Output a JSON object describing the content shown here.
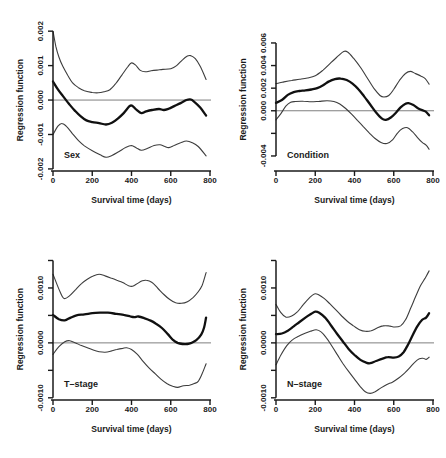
{
  "figure": {
    "style": {
      "background": "#ffffff",
      "band_color": "#3d3d3d",
      "estimate_color": "#101010",
      "axis_color": "#1a1a1a",
      "zero_line_color": "#707070",
      "text_color": "#1a1a1a"
    }
  },
  "chart_data": [
    {
      "type": "line",
      "title": "Sex",
      "xlabel": "Survival time (days)",
      "ylabel": "Regression function",
      "xlim": [
        0,
        800
      ],
      "ylim": [
        -0.00206,
        0.00215
      ],
      "grid": false,
      "zero_line": true,
      "xticks": [
        {
          "v": 0,
          "label": "0"
        },
        {
          "v": 200,
          "label": "200"
        },
        {
          "v": 400,
          "label": "400"
        },
        {
          "v": 600,
          "label": "600"
        },
        {
          "v": 800,
          "label": "800"
        }
      ],
      "yticks": [
        {
          "v": 0.002,
          "label": "0.002"
        },
        {
          "v": 0.001,
          "label": "0.001"
        },
        {
          "v": 0,
          "label": "0.000"
        },
        {
          "v": -0.001,
          "label": "-0.001"
        },
        {
          "v": -0.002,
          "label": "-0.002"
        }
      ],
      "series": [
        {
          "name": "upper confidence band",
          "role": "upper-ci",
          "x": [
            0,
            15,
            30,
            50,
            75,
            100,
            130,
            160,
            200,
            230,
            260,
            290,
            320,
            350,
            380,
            400,
            420,
            445,
            470,
            500,
            530,
            560,
            600,
            630,
            660,
            685,
            700,
            725,
            750,
            780
          ],
          "y": [
            0.002,
            0.00155,
            0.00125,
            0.00098,
            0.00072,
            0.0005,
            0.00036,
            0.00027,
            0.00022,
            0.00021,
            0.00024,
            0.0003,
            0.00048,
            0.00072,
            0.00096,
            0.00108,
            0.00102,
            0.00086,
            0.00082,
            0.00085,
            0.00087,
            0.00089,
            0.00091,
            0.001,
            0.00117,
            0.00128,
            0.00129,
            0.0012,
            0.00098,
            0.0006
          ]
        },
        {
          "name": "regression estimate",
          "role": "estimate",
          "x": [
            0,
            25,
            50,
            80,
            110,
            140,
            170,
            200,
            235,
            270,
            300,
            330,
            360,
            390,
            405,
            425,
            450,
            475,
            505,
            540,
            565,
            590,
            620,
            650,
            680,
            700,
            720,
            750,
            780
          ],
          "y": [
            0.00054,
            0.00031,
            0.00012,
            -0.0001,
            -0.0003,
            -0.00047,
            -0.00059,
            -0.00064,
            -0.00067,
            -0.00071,
            -0.00066,
            -0.00054,
            -0.00038,
            -0.00018,
            -0.00017,
            -0.00028,
            -0.00038,
            -0.00033,
            -0.00029,
            -0.00026,
            -0.00029,
            -0.00025,
            -0.00017,
            -9e-05,
            0,
            2e-05,
            -5e-05,
            -0.00022,
            -0.00045
          ]
        },
        {
          "name": "lower confidence band",
          "role": "lower-ci",
          "x": [
            0,
            25,
            45,
            70,
            100,
            130,
            160,
            200,
            240,
            270,
            300,
            335,
            370,
            400,
            425,
            450,
            480,
            515,
            545,
            570,
            590,
            620,
            650,
            680,
            710,
            740,
            780
          ],
          "y": [
            -0.001,
            -0.00076,
            -0.00068,
            -0.00077,
            -0.00098,
            -0.00118,
            -0.00133,
            -0.00147,
            -0.00159,
            -0.00166,
            -0.00161,
            -0.0015,
            -0.00138,
            -0.00132,
            -0.00139,
            -0.00146,
            -0.00141,
            -0.00132,
            -0.0013,
            -0.00135,
            -0.00138,
            -0.00131,
            -0.00124,
            -0.00119,
            -0.00124,
            -0.00135,
            -0.00162
          ]
        }
      ]
    },
    {
      "type": "line",
      "title": "Condition",
      "xlabel": "Survival time (days)",
      "ylabel": "Regression function",
      "xlim": [
        0,
        800
      ],
      "ylim": [
        -0.00533,
        0.0075
      ],
      "grid": false,
      "zero_line": true,
      "xticks": [
        {
          "v": 0,
          "label": "0"
        },
        {
          "v": 200,
          "label": "200"
        },
        {
          "v": 400,
          "label": "400"
        },
        {
          "v": 600,
          "label": "600"
        },
        {
          "v": 800,
          "label": "800"
        }
      ],
      "yticks": [
        {
          "v": 0.006,
          "label": "0.006"
        },
        {
          "v": 0.004,
          "label": "0.004"
        },
        {
          "v": 0.002,
          "label": "0.002"
        },
        {
          "v": 0,
          "label": "0.000"
        },
        {
          "v": -0.002,
          "label": ""
        },
        {
          "v": -0.004,
          "label": "-0.004"
        }
      ],
      "series": [
        {
          "name": "upper confidence band",
          "role": "upper-ci",
          "x": [
            0,
            40,
            80,
            120,
            160,
            200,
            240,
            280,
            320,
            345,
            365,
            395,
            430,
            465,
            500,
            530,
            550,
            575,
            600,
            630,
            660,
            685,
            710,
            740,
            760,
            780
          ],
          "y": [
            0.0024,
            0.00255,
            0.00268,
            0.00278,
            0.0029,
            0.0031,
            0.0036,
            0.00425,
            0.0049,
            0.00525,
            0.0052,
            0.00465,
            0.00385,
            0.0029,
            0.00195,
            0.00135,
            0.00122,
            0.00135,
            0.0019,
            0.0027,
            0.0033,
            0.00348,
            0.0033,
            0.00305,
            0.00285,
            0.00235
          ]
        },
        {
          "name": "regression estimate",
          "role": "estimate",
          "x": [
            0,
            30,
            60,
            90,
            120,
            150,
            180,
            210,
            240,
            270,
            300,
            330,
            360,
            390,
            420,
            450,
            480,
            510,
            540,
            560,
            585,
            610,
            635,
            660,
            675,
            700,
            725,
            750,
            765,
            780
          ],
          "y": [
            0.0007,
            0.00095,
            0.0014,
            0.00165,
            0.00175,
            0.0018,
            0.00188,
            0.002,
            0.00225,
            0.0026,
            0.0028,
            0.00285,
            0.00272,
            0.0024,
            0.0019,
            0.00125,
            0.00055,
            -0.00015,
            -0.0007,
            -0.0008,
            -0.0006,
            -0.0002,
            0.0003,
            0.00062,
            0.00068,
            0.0005,
            0.0002,
            2e-05,
            -0.0001,
            -0.0004
          ]
        },
        {
          "name": "lower confidence band",
          "role": "lower-ci",
          "x": [
            0,
            25,
            50,
            75,
            100,
            140,
            180,
            220,
            260,
            295,
            325,
            355,
            385,
            415,
            445,
            475,
            505,
            535,
            565,
            595,
            620,
            645,
            670,
            695,
            720,
            745,
            765,
            780
          ],
          "y": [
            -0.0008,
            -0.00025,
            0.0004,
            0.00075,
            0.00082,
            0.00084,
            0.0008,
            0.00083,
            0.00088,
            0.00082,
            0.0006,
            0.0002,
            -0.0003,
            -0.00085,
            -0.0014,
            -0.00195,
            -0.00245,
            -0.0028,
            -0.0029,
            -0.00255,
            -0.00195,
            -0.00158,
            -0.0015,
            -0.00185,
            -0.00235,
            -0.0028,
            -0.00305,
            -0.0034
          ]
        }
      ]
    },
    {
      "type": "line",
      "title": "T–stage",
      "xlabel": "Survival time (days)",
      "ylabel": "Regression function",
      "xlim": [
        0,
        800
      ],
      "ylim": [
        -0.00104,
        0.0016
      ],
      "grid": false,
      "zero_line": true,
      "xticks": [
        {
          "v": 0,
          "label": "0"
        },
        {
          "v": 200,
          "label": "200"
        },
        {
          "v": 400,
          "label": "400"
        },
        {
          "v": 600,
          "label": "600"
        },
        {
          "v": 800,
          "label": "800"
        }
      ],
      "yticks": [
        {
          "v": 0.0015,
          "label": ""
        },
        {
          "v": 0.001,
          "label": "0.0010"
        },
        {
          "v": 0.0005,
          "label": ""
        },
        {
          "v": 0,
          "label": "0.0000"
        },
        {
          "v": -0.0005,
          "label": ""
        },
        {
          "v": -0.001,
          "label": "-0.0010"
        }
      ],
      "series": [
        {
          "name": "upper confidence band",
          "role": "upper-ci",
          "x": [
            0,
            30,
            55,
            85,
            115,
            145,
            175,
            205,
            235,
            265,
            295,
            325,
            355,
            385,
            405,
            430,
            455,
            475,
            505,
            535,
            565,
            595,
            625,
            655,
            685,
            715,
            740,
            760,
            780
          ],
          "y": [
            0.00125,
            0.00098,
            0.00081,
            0.00086,
            0.00097,
            0.00108,
            0.00116,
            0.00122,
            0.00125,
            0.00122,
            0.00118,
            0.00114,
            0.0011,
            0.00104,
            0.00103,
            0.00108,
            0.00113,
            0.00114,
            0.0011,
            0.00099,
            0.00088,
            0.00079,
            0.00073,
            0.00072,
            0.00075,
            0.00083,
            0.00093,
            0.00105,
            0.00128
          ]
        },
        {
          "name": "regression estimate",
          "role": "estimate",
          "x": [
            0,
            30,
            60,
            90,
            120,
            160,
            200,
            240,
            280,
            320,
            360,
            395,
            415,
            435,
            465,
            495,
            525,
            555,
            585,
            610,
            635,
            660,
            685,
            705,
            730,
            755,
            770,
            780
          ],
          "y": [
            0.00051,
            0.00043,
            0.00041,
            0.00046,
            0.0005,
            0.00052,
            0.00054,
            0.00055,
            0.00055,
            0.00053,
            0.00051,
            0.00048,
            0.00047,
            0.00048,
            0.00045,
            0.00041,
            0.00035,
            0.00027,
            0.00016,
            6e-05,
            0,
            -2e-05,
            -2e-05,
            0,
            5e-05,
            0.00015,
            0.00028,
            0.00046
          ]
        },
        {
          "name": "lower confidence band",
          "role": "lower-ci",
          "x": [
            0,
            30,
            60,
            85,
            115,
            145,
            175,
            205,
            235,
            265,
            295,
            325,
            355,
            375,
            400,
            430,
            460,
            490,
            520,
            550,
            580,
            610,
            635,
            665,
            695,
            720,
            740,
            760,
            780
          ],
          "y": [
            -0.00021,
            -7e-05,
            2e-05,
            4e-05,
            0,
            -5e-05,
            -9e-05,
            -0.00013,
            -0.00016,
            -0.00017,
            -0.00015,
            -0.00012,
            -0.0001,
            -9e-05,
            -0.00012,
            -0.00021,
            -0.00034,
            -0.00046,
            -0.00056,
            -0.00066,
            -0.00074,
            -0.00079,
            -0.00081,
            -0.00078,
            -0.00077,
            -0.00074,
            -0.0007,
            -0.00056,
            -0.00038
          ]
        }
      ]
    },
    {
      "type": "line",
      "title": "N–stage",
      "xlabel": "Survival time (days)",
      "ylabel": "Regression function",
      "xlim": [
        0,
        800
      ],
      "ylim": [
        -0.00104,
        0.0016
      ],
      "grid": false,
      "zero_line": true,
      "xticks": [
        {
          "v": 0,
          "label": "0"
        },
        {
          "v": 200,
          "label": "200"
        },
        {
          "v": 400,
          "label": "400"
        },
        {
          "v": 600,
          "label": "600"
        },
        {
          "v": 800,
          "label": "800"
        }
      ],
      "yticks": [
        {
          "v": 0.0015,
          "label": ""
        },
        {
          "v": 0.001,
          "label": "0.0010"
        },
        {
          "v": 0.0005,
          "label": ""
        },
        {
          "v": 0,
          "label": "0.0000"
        },
        {
          "v": -0.0005,
          "label": ""
        },
        {
          "v": -0.001,
          "label": "-0.0010"
        }
      ],
      "series": [
        {
          "name": "upper confidence band",
          "role": "upper-ci",
          "x": [
            0,
            25,
            50,
            80,
            110,
            140,
            170,
            195,
            215,
            245,
            275,
            305,
            335,
            365,
            395,
            425,
            455,
            485,
            515,
            545,
            575,
            605,
            635,
            660,
            685,
            710,
            735,
            760,
            780
          ],
          "y": [
            0.0007,
            0.00055,
            0.00047,
            0.00049,
            0.00057,
            0.0007,
            0.00082,
            0.00089,
            0.00088,
            0.00081,
            0.00071,
            0.0006,
            0.00049,
            0.00039,
            0.00031,
            0.00024,
            0.00021,
            0.00022,
            0.00027,
            0.00031,
            0.00031,
            0.00029,
            0.00031,
            0.00042,
            0.00062,
            0.00083,
            0.00103,
            0.00118,
            0.00131
          ]
        },
        {
          "name": "regression estimate",
          "role": "estimate",
          "x": [
            0,
            30,
            60,
            90,
            120,
            150,
            180,
            200,
            220,
            250,
            280,
            310,
            340,
            370,
            400,
            430,
            460,
            480,
            510,
            540,
            570,
            600,
            625,
            650,
            670,
            695,
            720,
            745,
            765,
            780
          ],
          "y": [
            0.00016,
            0.00017,
            0.00022,
            0.0003,
            0.00038,
            0.00046,
            0.00053,
            0.00057,
            0.00055,
            0.00046,
            0.00032,
            0.00017,
            3e-05,
            -0.00011,
            -0.00022,
            -0.00031,
            -0.00036,
            -0.00037,
            -0.00033,
            -0.00029,
            -0.00026,
            -0.00027,
            -0.00025,
            -0.00017,
            -5e-05,
            0.00013,
            0.0003,
            0.00042,
            0.00046,
            0.00054
          ]
        },
        {
          "name": "lower confidence band",
          "role": "lower-ci",
          "x": [
            0,
            25,
            55,
            85,
            115,
            145,
            175,
            205,
            230,
            255,
            280,
            310,
            340,
            370,
            400,
            430,
            455,
            480,
            505,
            535,
            565,
            595,
            625,
            655,
            680,
            705,
            730,
            750,
            765,
            780
          ],
          "y": [
            -0.0004,
            -0.00022,
            -5e-05,
            6e-05,
            0.00012,
            0.00017,
            0.00021,
            0.00024,
            0.0002,
            0.0001,
            -3e-05,
            -0.0002,
            -0.00037,
            -0.00052,
            -0.00066,
            -0.0008,
            -0.00089,
            -0.00092,
            -0.00089,
            -0.00082,
            -0.00076,
            -0.00071,
            -0.00064,
            -0.00055,
            -0.00046,
            -0.00036,
            -0.00029,
            -0.00028,
            -0.0003,
            -0.00026
          ]
        }
      ]
    }
  ]
}
